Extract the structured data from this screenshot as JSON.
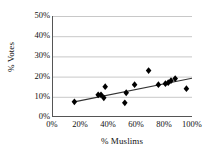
{
  "chart_data": {
    "type": "scatter",
    "title": "",
    "xlabel": "% Muslims",
    "ylabel": "% Votes",
    "xlim": [
      0,
      100
    ],
    "ylim": [
      0,
      50
    ],
    "grid": true,
    "legend": "none",
    "x_tick_labels": [
      "0%",
      "20%",
      "40%",
      "60%",
      "80%",
      "100%"
    ],
    "x_ticks": [
      0,
      20,
      40,
      60,
      80,
      100
    ],
    "y_tick_labels": [
      "0%",
      "10%",
      "20%",
      "30%",
      "40%",
      "50%"
    ],
    "y_ticks": [
      0,
      10,
      20,
      30,
      40,
      50
    ],
    "series": [
      {
        "name": "constituencies",
        "marker": "diamond",
        "color": "#000000",
        "points": [
          {
            "x": 16,
            "y": 7.5
          },
          {
            "x": 33,
            "y": 11
          },
          {
            "x": 35,
            "y": 11
          },
          {
            "x": 37,
            "y": 9.5
          },
          {
            "x": 38,
            "y": 15
          },
          {
            "x": 52,
            "y": 7
          },
          {
            "x": 53,
            "y": 12
          },
          {
            "x": 59,
            "y": 16
          },
          {
            "x": 69,
            "y": 23
          },
          {
            "x": 76,
            "y": 16
          },
          {
            "x": 81,
            "y": 16.5
          },
          {
            "x": 83,
            "y": 17
          },
          {
            "x": 85,
            "y": 18
          },
          {
            "x": 88,
            "y": 19
          },
          {
            "x": 96,
            "y": 14
          }
        ]
      }
    ],
    "trendline": {
      "name": "linear-fit",
      "color": "#333333",
      "x_start": 15,
      "y_start": 7.4,
      "x_end": 100,
      "y_end": 19.2
    }
  },
  "axes": {
    "y_title": "% Votes",
    "x_title": "% Muslims"
  },
  "colors": {
    "marker": "#000000",
    "trendline": "#333333",
    "gridline": "#c8c8c8",
    "axis": "#555555",
    "background": "#ffffff"
  }
}
